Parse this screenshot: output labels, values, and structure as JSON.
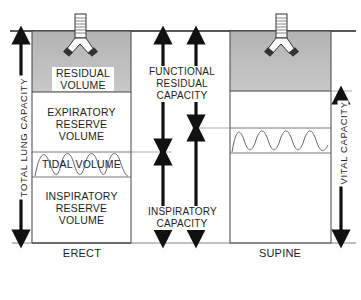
{
  "diagram": {
    "colors": {
      "line": "#2a2a2a",
      "arrow": "#111111",
      "residual_fill": "#bdbdbd",
      "background": "#ffffff"
    },
    "erect": {
      "label": "ERECT",
      "compartments": {
        "residual": [
          "RESIDUAL",
          "VOLUME"
        ],
        "expiratory": [
          "EXPIRATORY",
          "RESERVE",
          "VOLUME"
        ],
        "tidal": "TIDAL VOLUME",
        "inspiratory": [
          "INSPIRATORY",
          "RESERVE",
          "VOLUME"
        ]
      }
    },
    "supine": {
      "label": "SUPINE"
    },
    "capacities": {
      "total_lung": "TOTAL LUNG CAPACITY",
      "functional_residual": [
        "FUNCTIONAL",
        "RESIDUAL",
        "CAPACITY"
      ],
      "inspiratory": [
        "INSPIRATORY",
        "CAPACITY"
      ],
      "vital": "VITAL CAPACITY"
    }
  }
}
